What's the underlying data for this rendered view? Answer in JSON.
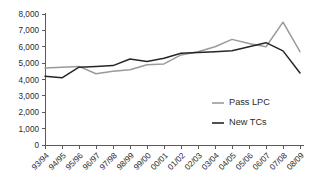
{
  "chart_data": {
    "type": "line",
    "title": "",
    "subtitle": "",
    "xlabel": "",
    "ylabel": "",
    "grid": false,
    "legend_position": "inside-right",
    "categories": [
      "93/94",
      "94/95",
      "95/96",
      "96/97",
      "97/98",
      "98/99",
      "99/00",
      "00/01",
      "01/02",
      "02/03",
      "03/04",
      "04/05",
      "05/06",
      "06/07",
      "07/08",
      "08/09"
    ],
    "ylim": [
      0,
      8000
    ],
    "ytick_values": [
      0,
      1000,
      2000,
      3000,
      4000,
      5000,
      6000,
      7000,
      8000
    ],
    "ytick_labels": [
      "0",
      "1,000",
      "2,000",
      "3,000",
      "4,000",
      "5,000",
      "6,000",
      "7,000",
      "8,000"
    ],
    "series": [
      {
        "name": "Pass LPC",
        "color": "#9a9a9a",
        "values": [
          4700,
          4750,
          4800,
          4350,
          4500,
          4600,
          4900,
          4950,
          5500,
          5700,
          6000,
          6450,
          6200,
          6000,
          7500,
          5700
        ]
      },
      {
        "name": "New TCs",
        "color": "#262626",
        "values": [
          4200,
          4100,
          4750,
          4800,
          4850,
          5250,
          5100,
          5300,
          5600,
          5650,
          5700,
          5750,
          6000,
          6250,
          5750,
          4400
        ]
      }
    ]
  },
  "legend": {
    "items": [
      {
        "label": "Pass LPC",
        "color": "#9a9a9a"
      },
      {
        "label": "New TCs",
        "color": "#262626"
      }
    ]
  },
  "axes": {
    "axis_color": "#5a5a5a"
  }
}
